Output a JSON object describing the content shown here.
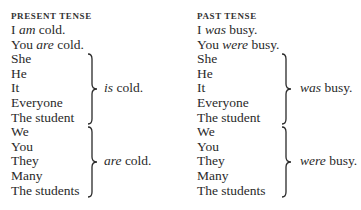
{
  "present": {
    "header": "PRESENT TENSE",
    "lines": [
      {
        "pre": "I ",
        "verb": "am",
        "post": " cold."
      },
      {
        "pre": "You ",
        "verb": "are",
        "post": " cold."
      }
    ],
    "singular_group": {
      "subjects": [
        "She",
        "He",
        "It",
        "Everyone",
        "The student"
      ],
      "verb": "is",
      "rest": " cold."
    },
    "plural_group": {
      "subjects": [
        "We",
        "You",
        "They",
        "Many",
        "The students"
      ],
      "verb": "are",
      "rest": " cold."
    }
  },
  "past": {
    "header": "PAST TENSE",
    "lines": [
      {
        "pre": "I ",
        "verb": "was",
        "post": " busy."
      },
      {
        "pre": "You ",
        "verb": "were",
        "post": " busy."
      }
    ],
    "singular_group": {
      "subjects": [
        "She",
        "He",
        "It",
        "Everyone",
        "The student"
      ],
      "verb": "was",
      "rest": " busy."
    },
    "plural_group": {
      "subjects": [
        "We",
        "You",
        "They",
        "Many",
        "The students"
      ],
      "verb": "were",
      "rest": " busy."
    }
  }
}
